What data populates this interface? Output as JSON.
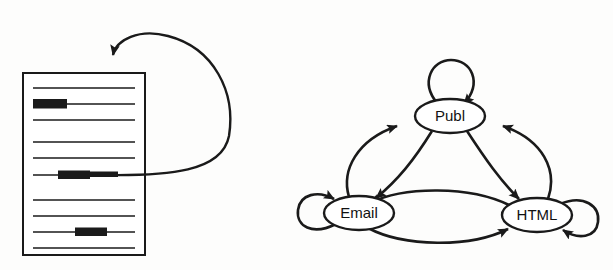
{
  "figure": {
    "background_color": "#fdfdfc",
    "ink_color": "#1a1a1a",
    "width": 613,
    "height": 270
  },
  "document_panel": {
    "name": "document-with-highlights",
    "page": {
      "x": 23,
      "y": 73,
      "width": 122,
      "height": 182,
      "fill": "#ffffff",
      "border_color": "#1a1a1a",
      "border_width": 2
    },
    "text_lines": [
      {
        "id": "line-1",
        "y": 88,
        "x1": 33,
        "x2": 135,
        "highlighted": false
      },
      {
        "id": "line-2",
        "y": 104,
        "x1": 33,
        "x2": 135,
        "highlighted": true,
        "highlight_x1": 33,
        "highlight_x2": 67
      },
      {
        "id": "line-3",
        "y": 120,
        "x1": 33,
        "x2": 135,
        "highlighted": false
      },
      {
        "id": "line-4",
        "y": 142,
        "x1": 33,
        "x2": 135,
        "highlighted": false
      },
      {
        "id": "line-5",
        "y": 158,
        "x1": 33,
        "x2": 135,
        "highlighted": false
      },
      {
        "id": "line-6",
        "y": 175,
        "x1": 33,
        "x2": 135,
        "highlighted": true,
        "highlight_x1": 58,
        "highlight_x2": 106
      },
      {
        "id": "line-7",
        "y": 200,
        "x1": 33,
        "x2": 135,
        "highlighted": false
      },
      {
        "id": "line-8",
        "y": 216,
        "x1": 33,
        "x2": 135,
        "highlighted": false
      },
      {
        "id": "line-9",
        "y": 232,
        "x1": 33,
        "x2": 135,
        "highlighted": true,
        "highlight_x1": 75,
        "highlight_x2": 107
      },
      {
        "id": "line-10",
        "y": 248,
        "x1": 33,
        "x2": 135,
        "highlighted": false
      }
    ],
    "feedback_arrow": {
      "name": "highlight-to-top-feedback-arrow",
      "from": "highlighted line-6 (middle of page)",
      "to": "top edge of page",
      "path": "M 106 175 C 175 175 228 170 230 110 C 232 48 168 20 124 40 C 113 45 111 52 111 58",
      "arrow_tip": {
        "x": 111,
        "y": 72
      }
    }
  },
  "state_diagram": {
    "name": "publ-email-html-state-graph",
    "nodes": [
      {
        "id": "publ",
        "label": "Publ",
        "cx": 450,
        "cy": 116,
        "rx": 35,
        "ry": 17
      },
      {
        "id": "email",
        "label": "Email",
        "cx": 359,
        "cy": 213,
        "rx": 35,
        "ry": 17
      },
      {
        "id": "html",
        "label": "HTML",
        "cx": 537,
        "cy": 215,
        "rx": 35,
        "ry": 17
      }
    ],
    "self_loops": [
      {
        "id": "publ-self-loop",
        "node": "publ",
        "position": "top"
      },
      {
        "id": "email-self-loop",
        "node": "email",
        "position": "left"
      },
      {
        "id": "html-self-loop",
        "node": "html",
        "position": "right"
      }
    ],
    "edges": [
      {
        "id": "email-to-publ",
        "from": "email",
        "to": "publ"
      },
      {
        "id": "publ-to-email",
        "from": "publ",
        "to": "email"
      },
      {
        "id": "publ-to-html",
        "from": "publ",
        "to": "html"
      },
      {
        "id": "html-to-publ",
        "from": "html",
        "to": "publ"
      },
      {
        "id": "email-to-html",
        "from": "email",
        "to": "html"
      },
      {
        "id": "html-to-email",
        "from": "html",
        "to": "email"
      }
    ]
  }
}
